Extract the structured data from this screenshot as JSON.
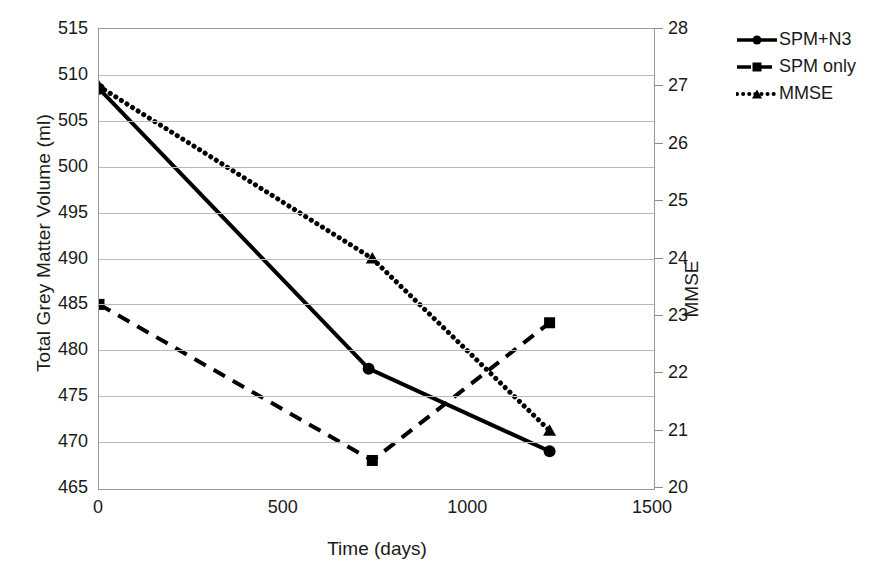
{
  "chart_data": {
    "type": "line",
    "title": "",
    "xlabel": "Time (days)",
    "ylabel": "Total Grey Matter Volume (ml)",
    "y2label": "MMSE",
    "xlim": [
      0,
      1500
    ],
    "ylim": [
      465,
      515
    ],
    "y2lim": [
      20,
      28
    ],
    "xticks": [
      "0",
      "500",
      "1000",
      "1500"
    ],
    "xtick_values": [
      0,
      500,
      1000,
      1500
    ],
    "yticks": [
      "465",
      "470",
      "475",
      "480",
      "485",
      "490",
      "495",
      "500",
      "505",
      "510",
      "515"
    ],
    "ytick_values": [
      465,
      470,
      475,
      480,
      485,
      490,
      495,
      500,
      505,
      510,
      515
    ],
    "y2ticks": [
      "20",
      "21",
      "22",
      "23",
      "24",
      "25",
      "26",
      "27",
      "28"
    ],
    "y2tick_values": [
      20,
      21,
      22,
      23,
      24,
      25,
      26,
      27,
      28
    ],
    "grid": true,
    "legend_position": "right",
    "series": [
      {
        "name": "SPM+N3",
        "axis": "left",
        "marker": "circle",
        "linestyle": "solid",
        "color": "#000000",
        "x": [
          0,
          730,
          1220
        ],
        "values": [
          508.5,
          478,
          469
        ]
      },
      {
        "name": "SPM only",
        "axis": "left",
        "marker": "square",
        "linestyle": "dashed",
        "color": "#000000",
        "x": [
          0,
          740,
          1220
        ],
        "values": [
          485,
          468,
          483
        ]
      },
      {
        "name": "MMSE",
        "axis": "right",
        "marker": "triangle",
        "linestyle": "dotted",
        "color": "#000000",
        "x": [
          0,
          740,
          1220
        ],
        "values": [
          27,
          24,
          21
        ]
      }
    ]
  },
  "legend": {
    "items": [
      {
        "label": "SPM+N3"
      },
      {
        "label": "SPM only"
      },
      {
        "label": "MMSE"
      }
    ]
  },
  "axes": {
    "x_title": "Time (days)",
    "y_left_title": "Total Grey Matter Volume (ml)",
    "y_right_title": "MMSE"
  },
  "colors": {
    "series": "#000000",
    "grid": "#b9b9b9",
    "frame": "#9a9a9a",
    "background": "#ffffff"
  }
}
